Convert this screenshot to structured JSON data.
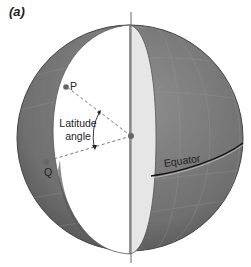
{
  "figure": {
    "panel_label": "(a)",
    "labels": {
      "point_p": "P",
      "point_q": "Q",
      "latitude_line1": "Latitude",
      "latitude_line2": "angle",
      "equator": "Equator"
    },
    "colors": {
      "globe_fill": "#7a7a7a",
      "globe_dark": "#555555",
      "cutaway_fill": "#ffffff",
      "cross_section": "#e4e4e4",
      "axis": "#666666",
      "points": "#666666",
      "dashed": "#777777"
    }
  }
}
